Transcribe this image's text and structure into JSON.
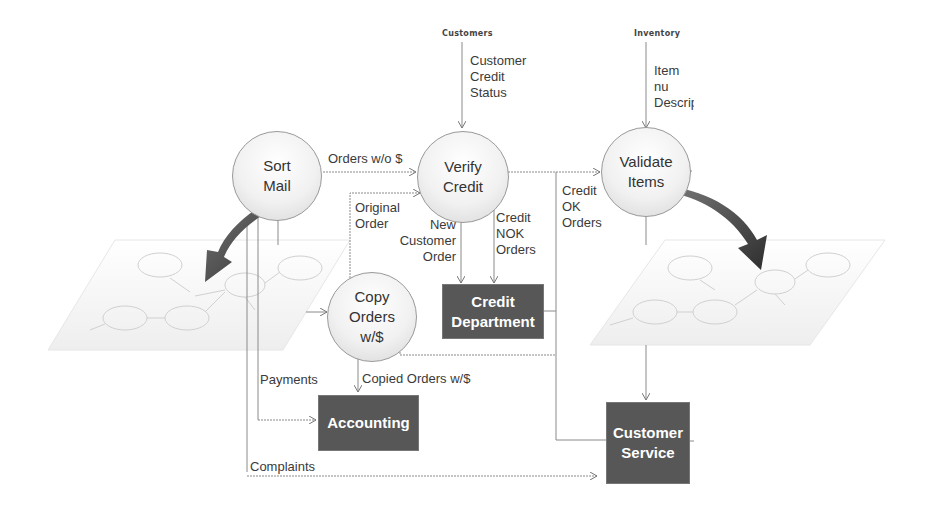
{
  "diagram": {
    "type": "data-flow-diagram",
    "external_sources": [
      {
        "id": "customers",
        "label": "Customers"
      },
      {
        "id": "inventory",
        "label": "Inventory"
      }
    ],
    "processes": [
      {
        "id": "sort_mail",
        "label": "Sort\nMail"
      },
      {
        "id": "verify_credit",
        "label": "Verify\nCredit"
      },
      {
        "id": "validate_items",
        "label": "Validate\nItems"
      },
      {
        "id": "copy_orders",
        "label": "Copy\nOrders\nw/$"
      }
    ],
    "entities": [
      {
        "id": "credit_department",
        "label": "Credit\nDepartment"
      },
      {
        "id": "accounting",
        "label": "Accounting"
      },
      {
        "id": "customer_service",
        "label": "Customer\nService"
      }
    ],
    "flows": {
      "customer_credit_status": "Customer\nCredit\nStatus",
      "item_number_description": "Item nu\nDescrip",
      "orders_without_money": "Orders w/o $",
      "original_order": "Original\nOrder",
      "new_customer_order": "New\nCustomer\nOrder",
      "credit_nok_orders": "Credit\nNOK\nOrders",
      "credit_ok_orders": "Credit\nOK\nOrders",
      "payments": "Payments",
      "copied_orders": "Copied Orders w/$",
      "complaints": "Complaints"
    },
    "colors": {
      "entity_fill": "#575757",
      "entity_text": "#ffffff",
      "line": "#8a8a8a",
      "zoom_arrow": "#3c3c3c"
    }
  }
}
